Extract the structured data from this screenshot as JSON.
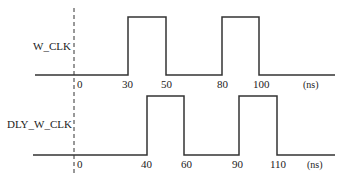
{
  "diagram": {
    "type": "timing-diagram",
    "zero_marker": "0",
    "signals": [
      {
        "name": "W_CLK",
        "high_intervals": [
          [
            30,
            50
          ],
          [
            80,
            100
          ]
        ],
        "ticks": [
          "30",
          "50",
          "80",
          "100"
        ],
        "unit": "(ns)"
      },
      {
        "name": "DLY_W_CLK",
        "high_intervals": [
          [
            40,
            60
          ],
          [
            90,
            110
          ]
        ],
        "ticks": [
          "40",
          "60",
          "90",
          "110"
        ],
        "unit": "(ns)"
      }
    ]
  },
  "colors": {
    "line": "#333333",
    "text": "#222222",
    "background": "#ffffff"
  }
}
